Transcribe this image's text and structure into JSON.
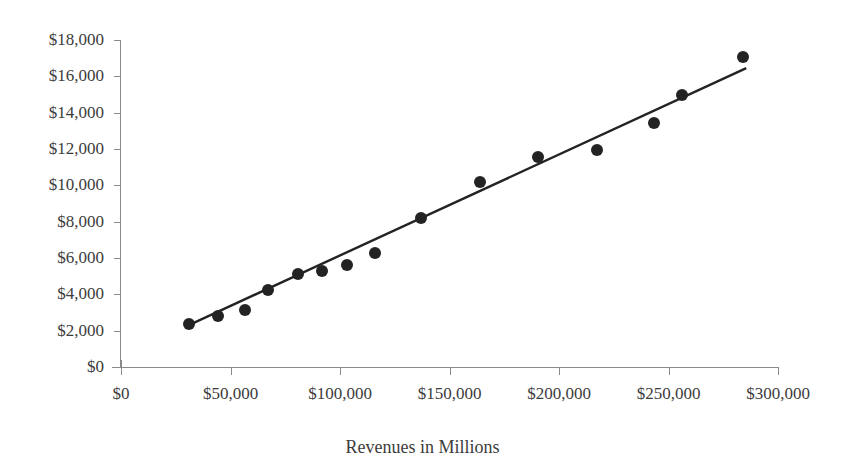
{
  "figure": {
    "title_remnant": "",
    "background": "#ffffff",
    "marker_color": "#232323",
    "line_color": "#232323",
    "axis_color": "#8a8a8a",
    "text_color": "#3c3c3c"
  },
  "axes": {
    "y_ticks": [
      "$0",
      "$2,000",
      "$4,000",
      "$6,000",
      "$8,000",
      "$10,000",
      "$12,000",
      "$14,000",
      "$16,000",
      "$18,000"
    ],
    "x_ticks": [
      "$0",
      "$50,000",
      "$100,000",
      "$150,000",
      "$200,000",
      "$250,000",
      "$300,000"
    ],
    "x_axis_title": "Revenues in Millions",
    "y_axis_title": ""
  },
  "chart_data": {
    "type": "scatter",
    "title": "",
    "subtitle": "",
    "xlabel": "Revenues in Millions",
    "ylabel": "",
    "xlim": [
      0,
      300000
    ],
    "ylim": [
      0,
      18000
    ],
    "xtick_step": 50000,
    "ytick_step": 2000,
    "grid": false,
    "legend": null,
    "series": [
      {
        "name": "Observations",
        "type": "scatter",
        "marker": "filled-circle",
        "color": "#232323",
        "points": [
          {
            "x": 31000,
            "y": 2350
          },
          {
            "x": 44400,
            "y": 2800
          },
          {
            "x": 56700,
            "y": 3150
          },
          {
            "x": 67000,
            "y": 4250
          },
          {
            "x": 81000,
            "y": 5100
          },
          {
            "x": 92000,
            "y": 5300
          },
          {
            "x": 103400,
            "y": 5600
          },
          {
            "x": 116200,
            "y": 6300
          },
          {
            "x": 136800,
            "y": 8200
          },
          {
            "x": 163800,
            "y": 10200
          },
          {
            "x": 190300,
            "y": 11550
          },
          {
            "x": 217300,
            "y": 11950
          },
          {
            "x": 243400,
            "y": 13450
          },
          {
            "x": 256200,
            "y": 14950
          },
          {
            "x": 284000,
            "y": 17050
          }
        ]
      },
      {
        "name": "Trend line",
        "type": "line",
        "color": "#232323",
        "endpoints": [
          {
            "x": 30000,
            "y": 2250
          },
          {
            "x": 285500,
            "y": 16450
          }
        ]
      }
    ]
  }
}
